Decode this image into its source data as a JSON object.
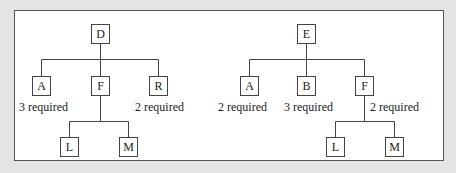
{
  "diagrams": [
    {
      "root": "D",
      "children": [
        {
          "node": "A",
          "label": "3 required"
        },
        {
          "node": "F",
          "label": "",
          "children": [
            "L",
            "M"
          ]
        },
        {
          "node": "R",
          "label": "2 required"
        }
      ]
    },
    {
      "root": "E",
      "children": [
        {
          "node": "A",
          "label": "2 required"
        },
        {
          "node": "B",
          "label": "3 required"
        },
        {
          "node": "F",
          "label": "2 required",
          "children": [
            "L",
            "M"
          ]
        }
      ]
    }
  ],
  "tree1": {
    "root": "D",
    "a": "A",
    "a_label": "3 required",
    "f": "F",
    "r": "R",
    "r_label": "2 required",
    "l": "L",
    "m": "M"
  },
  "tree2": {
    "root": "E",
    "a": "A",
    "a_label": "2 required",
    "b": "B",
    "b_label": "3 required",
    "f": "F",
    "f_label": "2 required",
    "l": "L",
    "m": "M"
  }
}
